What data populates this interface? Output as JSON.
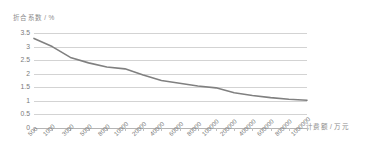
{
  "chart_data": {
    "type": "line",
    "title": "",
    "subtitle": "",
    "ylabel": "折合系数 / %",
    "xlabel": "计费额 / 万元",
    "categories": [
      "500",
      "1000",
      "3000",
      "5000",
      "8000",
      "10000",
      "20000",
      "40000",
      "60000",
      "80000",
      "100000",
      "200000",
      "400000",
      "600000",
      "800000",
      "1000000"
    ],
    "values": [
      3.3,
      3.0,
      2.6,
      2.4,
      2.25,
      2.18,
      1.95,
      1.75,
      1.65,
      1.55,
      1.48,
      1.3,
      1.2,
      1.12,
      1.06,
      1.02
    ],
    "series": [
      {
        "name": "折合系数",
        "values": [
          3.3,
          3.0,
          2.6,
          2.4,
          2.25,
          2.18,
          1.95,
          1.75,
          1.65,
          1.55,
          1.48,
          1.3,
          1.2,
          1.12,
          1.06,
          1.02
        ]
      }
    ],
    "y_ticks": [
      "3.5",
      "3",
      "2.5",
      "2",
      "1.5",
      "1",
      "0.5",
      "0"
    ],
    "y_tick_values": [
      3.5,
      3.0,
      2.5,
      2.0,
      1.5,
      1.0,
      0.5,
      0
    ],
    "ylim": [
      0,
      3.5
    ],
    "grid": "horizontal",
    "legend": "none",
    "line_color": "#808080",
    "grid_color": "#d3d3d3",
    "axis_color": "#b4b4b4",
    "text_color": "#7a7a7a",
    "background": "#ffffff"
  }
}
